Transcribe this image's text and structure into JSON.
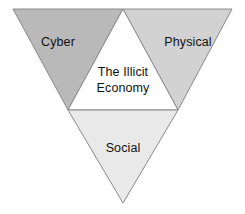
{
  "diagram": {
    "type": "inverted-triangle-partition",
    "background_color": "#ffffff",
    "outline_color": "#808080",
    "text_color": "#111111",
    "segments": [
      {
        "id": "cyber",
        "label": "Cyber",
        "position": "top-left",
        "fill_color": "#b9b9b9",
        "orientation": "inverted"
      },
      {
        "id": "physical",
        "label": "Physical",
        "position": "top-right",
        "fill_color": "#d2d2d2",
        "orientation": "inverted"
      },
      {
        "id": "center",
        "label_line1": "The Illicit",
        "label_line2": "Economy",
        "position": "center",
        "fill_color": "#ffffff",
        "orientation": "upright"
      },
      {
        "id": "social",
        "label": "Social",
        "position": "bottom",
        "fill_color": "#e9e9e9",
        "orientation": "inverted"
      }
    ]
  }
}
